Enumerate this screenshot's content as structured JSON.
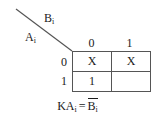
{
  "figure": {
    "background_color": "#ffffff",
    "line_color": "#555555",
    "text_color": "#1a1a1a"
  },
  "axis": {
    "column_variable": "B",
    "column_variable_subscript": "i",
    "row_variable": "A",
    "row_variable_subscript": "i",
    "divider": "diagonal-line"
  },
  "table": {
    "column_headers": [
      "0",
      "1"
    ],
    "row_headers": [
      "0",
      "1"
    ],
    "cells": [
      [
        "X",
        "X"
      ],
      [
        "1",
        ""
      ]
    ]
  },
  "caption": {
    "lhs": "KA",
    "lhs_subscript": "i",
    "equals": "=",
    "rhs": "B",
    "rhs_subscript": "i",
    "rhs_overline": true,
    "full_text": "KA_i = B̄_i"
  }
}
